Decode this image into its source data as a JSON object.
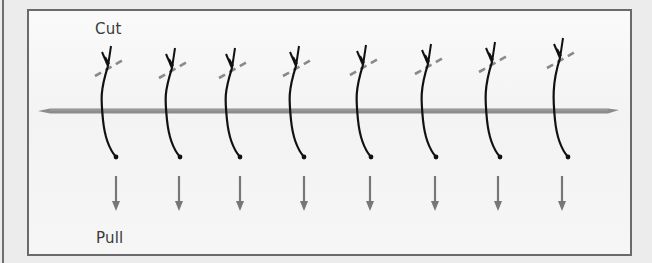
{
  "labels": {
    "top": "Cut",
    "bottom": "Pull"
  },
  "colors": {
    "suture": "#111111",
    "cut_line": "#8a8a8a",
    "wound_bar": "#8c8c8c",
    "arrow": "#777777",
    "frame": "#6a6a6a"
  },
  "sutures": [
    {
      "x": 108,
      "knot_y": 48
    },
    {
      "x": 172,
      "knot_y": 50
    },
    {
      "x": 232,
      "knot_y": 50
    },
    {
      "x": 296,
      "knot_y": 48
    },
    {
      "x": 363,
      "knot_y": 47
    },
    {
      "x": 428,
      "knot_y": 46
    },
    {
      "x": 492,
      "knot_y": 44
    },
    {
      "x": 560,
      "knot_y": 40
    }
  ],
  "arrows_x": [
    116,
    179,
    240,
    304,
    370,
    435,
    498,
    562
  ]
}
